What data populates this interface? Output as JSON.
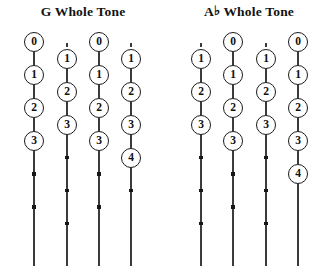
{
  "page": {
    "width": 332,
    "height": 276,
    "background": "#ffffff",
    "ink": "#1a1a1a",
    "string_color": "#3b3b3b"
  },
  "diagram": {
    "type": "guitar-fretboard-scale-chart",
    "orientation": "vertical-strings",
    "circle_diameter": 20,
    "step": 33,
    "groups": [
      {
        "id": "g-whole-tone",
        "title": "G Whole Tone",
        "title_prefix": "G",
        "accidental": "",
        "left": 0,
        "width": 166,
        "strings": [
          {
            "id": "g-string-1",
            "x": 34,
            "offset": 0,
            "top_stub": false,
            "frets": [
              0,
              1,
              2,
              3
            ],
            "trailing_dots": 2
          },
          {
            "id": "g-string-2",
            "x": 67,
            "offset": 1,
            "top_stub": true,
            "frets": [
              1,
              2,
              3
            ],
            "trailing_dots": 3
          },
          {
            "id": "g-string-3",
            "x": 99,
            "offset": 0,
            "top_stub": false,
            "frets": [
              0,
              1,
              2,
              3
            ],
            "trailing_dots": 2
          },
          {
            "id": "g-string-4",
            "x": 131,
            "offset": 1,
            "top_stub": true,
            "frets": [
              1,
              2,
              3,
              4
            ],
            "trailing_dots": 1
          }
        ]
      },
      {
        "id": "ab-whole-tone",
        "title": "A♭ Whole Tone",
        "title_prefix": "A",
        "accidental": "♭",
        "title_suffix": " Whole Tone",
        "left": 166,
        "width": 166,
        "strings": [
          {
            "id": "ab-string-1",
            "x": 201,
            "offset": 1,
            "top_stub": true,
            "frets": [
              1,
              2,
              3
            ],
            "trailing_dots": 3
          },
          {
            "id": "ab-string-2",
            "x": 233,
            "offset": 0,
            "top_stub": false,
            "frets": [
              0,
              1,
              2,
              3
            ],
            "trailing_dots": 2
          },
          {
            "id": "ab-string-3",
            "x": 266,
            "offset": 1,
            "top_stub": true,
            "frets": [
              1,
              2,
              3
            ],
            "trailing_dots": 3
          },
          {
            "id": "ab-string-4",
            "x": 298,
            "offset": 0,
            "top_stub": false,
            "frets": [
              0,
              1,
              2,
              3,
              4
            ],
            "trailing_dots": 0
          }
        ]
      }
    ]
  }
}
